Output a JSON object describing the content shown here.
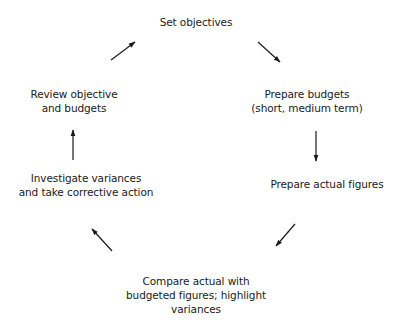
{
  "diagram": {
    "type": "cycle",
    "title": "",
    "colors": {
      "text": "#1a1a1a",
      "arrow": "#1a1a1a",
      "background": "#ffffff"
    },
    "nodes": [
      {
        "id": "set-objectives",
        "lines": [
          "Set objectives"
        ]
      },
      {
        "id": "prepare-budgets",
        "lines": [
          "Prepare budgets",
          "(short, medium term)"
        ]
      },
      {
        "id": "prepare-actual-figures",
        "lines": [
          "Prepare actual figures"
        ]
      },
      {
        "id": "compare-actual",
        "lines": [
          "Compare actual with",
          "budgeted figures; highlight",
          "variances"
        ]
      },
      {
        "id": "investigate-variances",
        "lines": [
          "Investigate variances",
          "and take corrective action"
        ]
      },
      {
        "id": "review-objective",
        "lines": [
          "Review objective",
          "and budgets"
        ]
      }
    ],
    "edges": [
      {
        "from": "set-objectives",
        "to": "prepare-budgets",
        "direction": "down-right"
      },
      {
        "from": "prepare-budgets",
        "to": "prepare-actual-figures",
        "direction": "down"
      },
      {
        "from": "prepare-actual-figures",
        "to": "compare-actual",
        "direction": "down-left"
      },
      {
        "from": "compare-actual",
        "to": "investigate-variances",
        "direction": "up-left"
      },
      {
        "from": "investigate-variances",
        "to": "review-objective",
        "direction": "up"
      },
      {
        "from": "review-objective",
        "to": "set-objectives",
        "direction": "up-right"
      }
    ]
  }
}
